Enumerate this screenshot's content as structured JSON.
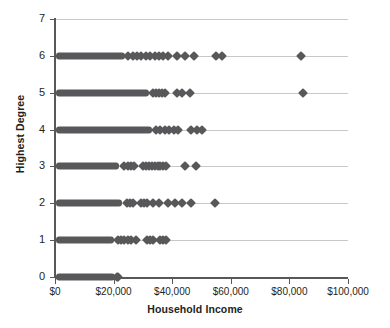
{
  "chart_data": {
    "type": "scatter",
    "title": "",
    "xlabel": "Household Income",
    "ylabel": "Highest Degree",
    "xlim": [
      0,
      100000
    ],
    "ylim": [
      0,
      7
    ],
    "grid": true,
    "legend": "none",
    "marker": "diamond",
    "marker_color": "#58585b",
    "axis_color": "#58585b",
    "gridline_color": "#c8c8cc",
    "x_ticks": [
      0,
      20000,
      40000,
      60000,
      80000,
      100000
    ],
    "x_tick_labels": [
      "$0",
      "$20,000",
      "$40,000",
      "$60,000",
      "$80,000",
      "$100,000"
    ],
    "y_ticks": [
      0,
      1,
      2,
      3,
      4,
      5,
      6,
      7
    ],
    "y_tick_labels": [
      "0",
      "1",
      "2",
      "3",
      "4",
      "5",
      "6",
      "7"
    ],
    "series": [
      {
        "name": "Highest Degree 0",
        "y": 0,
        "dense_range": [
          500,
          20500
        ],
        "x": [
          21000,
          21500
        ]
      },
      {
        "name": "Highest Degree 1",
        "y": 1,
        "dense_range": [
          500,
          20000
        ],
        "x": [
          21500,
          22500,
          23500,
          25000,
          26000,
          27500,
          31500,
          32500,
          33500,
          36000,
          37000,
          38000
        ]
      },
      {
        "name": "Highest Degree 2",
        "y": 2,
        "dense_range": [
          500,
          23000
        ],
        "x": [
          24500,
          25500,
          26500,
          29500,
          30500,
          31500,
          33500,
          35500,
          38500,
          41000,
          43500,
          46500,
          54500
        ]
      },
      {
        "name": "Highest Degree 3",
        "y": 3,
        "dense_range": [
          500,
          22000
        ],
        "x": [
          23500,
          25000,
          26000,
          27000,
          30000,
          31000,
          32000,
          33000,
          34000,
          35000,
          36000,
          37000,
          38000,
          44500,
          48000
        ]
      },
      {
        "name": "Highest Degree 4",
        "y": 4,
        "dense_range": [
          500,
          33000
        ],
        "x": [
          34500,
          36000,
          37500,
          39000,
          40500,
          42000,
          46500,
          48500,
          50000
        ]
      },
      {
        "name": "Highest Degree 5",
        "y": 5,
        "dense_range": [
          500,
          32000
        ],
        "x": [
          33500,
          34500,
          35500,
          36500,
          37500,
          41500,
          43500,
          46000,
          84500
        ]
      },
      {
        "name": "Highest Degree 6",
        "y": 6,
        "dense_range": [
          500,
          24000
        ],
        "x": [
          25000,
          26500,
          28000,
          29500,
          31000,
          32500,
          34000,
          35500,
          37000,
          38500,
          41500,
          44500,
          47500,
          55000,
          57000,
          84000
        ]
      }
    ]
  },
  "axes": {
    "x_title": "Household Income",
    "y_title": "Highest Degree"
  }
}
